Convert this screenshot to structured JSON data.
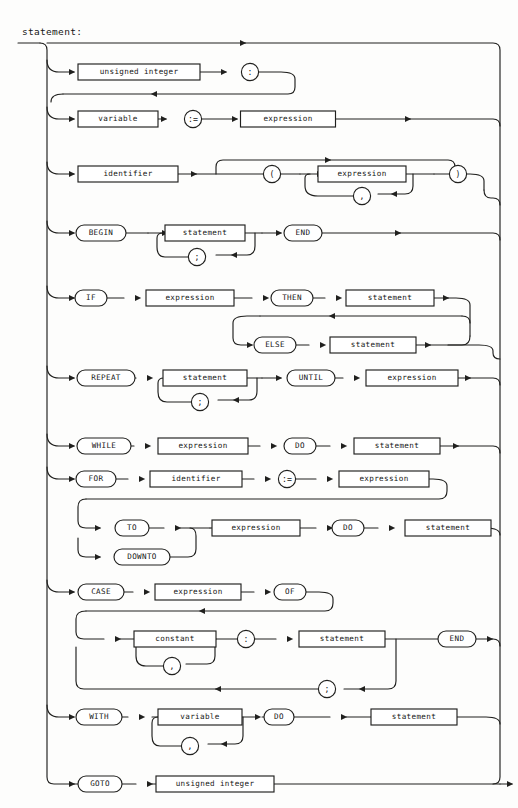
{
  "page": {
    "header_center": "",
    "header_right": "",
    "title": "statement:",
    "ink_color": "#20201e",
    "paper_color": "#fdfdfc"
  },
  "diagram": {
    "kind": "railroad-syntax-diagram",
    "name": "statement",
    "language": "Pascal",
    "alternatives": [
      {
        "id": "label-stmt",
        "index": 1,
        "nodes": [
          {
            "text": "unsigned integer",
            "shape": "box"
          },
          {
            "text": ":",
            "shape": "circle"
          }
        ],
        "note": "optional label prefix, loops back to statement alternatives"
      },
      {
        "id": "assignment",
        "index": 2,
        "nodes": [
          {
            "text": "variable",
            "shape": "box"
          },
          {
            "text": ":=",
            "shape": "circle"
          },
          {
            "text": "expression",
            "shape": "box"
          }
        ]
      },
      {
        "id": "procedure-call",
        "index": 3,
        "nodes": [
          {
            "text": "identifier",
            "shape": "box"
          },
          {
            "text": "(",
            "shape": "circle"
          },
          {
            "text": "expression",
            "shape": "box"
          },
          {
            "text": ",",
            "shape": "circle"
          },
          {
            "text": ")",
            "shape": "circle"
          }
        ],
        "note": "argument list optional; expressions separated by comma"
      },
      {
        "id": "compound",
        "index": 4,
        "nodes": [
          {
            "text": "BEGIN",
            "shape": "oval"
          },
          {
            "text": "statement",
            "shape": "box"
          },
          {
            "text": ";",
            "shape": "circle"
          },
          {
            "text": "END",
            "shape": "oval"
          }
        ]
      },
      {
        "id": "if-then-else",
        "index": 5,
        "nodes": [
          {
            "text": "IF",
            "shape": "oval"
          },
          {
            "text": "expression",
            "shape": "box"
          },
          {
            "text": "THEN",
            "shape": "oval"
          },
          {
            "text": "statement",
            "shape": "box"
          },
          {
            "text": "ELSE",
            "shape": "oval"
          },
          {
            "text": "statement",
            "shape": "box"
          }
        ]
      },
      {
        "id": "repeat-until",
        "index": 6,
        "nodes": [
          {
            "text": "REPEAT",
            "shape": "oval"
          },
          {
            "text": "statement",
            "shape": "box"
          },
          {
            "text": ";",
            "shape": "circle"
          },
          {
            "text": "UNTIL",
            "shape": "oval"
          },
          {
            "text": "expression",
            "shape": "box"
          }
        ]
      },
      {
        "id": "while-do",
        "index": 7,
        "nodes": [
          {
            "text": "WHILE",
            "shape": "oval"
          },
          {
            "text": "expression",
            "shape": "box"
          },
          {
            "text": "DO",
            "shape": "oval"
          },
          {
            "text": "statement",
            "shape": "box"
          }
        ]
      },
      {
        "id": "for-do",
        "index": 8,
        "nodes": [
          {
            "text": "FOR",
            "shape": "oval"
          },
          {
            "text": "identifier",
            "shape": "box"
          },
          {
            "text": ":=",
            "shape": "circle"
          },
          {
            "text": "expression",
            "shape": "box"
          },
          {
            "text": "TO",
            "shape": "oval"
          },
          {
            "text": "DOWNTO",
            "shape": "oval"
          },
          {
            "text": "expression",
            "shape": "box"
          },
          {
            "text": "DO",
            "shape": "oval"
          },
          {
            "text": "statement",
            "shape": "box"
          }
        ]
      },
      {
        "id": "case-of",
        "index": 9,
        "nodes": [
          {
            "text": "CASE",
            "shape": "oval"
          },
          {
            "text": "expression",
            "shape": "box"
          },
          {
            "text": "OF",
            "shape": "oval"
          },
          {
            "text": "constant",
            "shape": "box"
          },
          {
            "text": ",",
            "shape": "circle"
          },
          {
            "text": ":",
            "shape": "circle"
          },
          {
            "text": "statement",
            "shape": "box"
          },
          {
            "text": ";",
            "shape": "circle"
          },
          {
            "text": "END",
            "shape": "oval"
          }
        ]
      },
      {
        "id": "with-do",
        "index": 10,
        "nodes": [
          {
            "text": "WITH",
            "shape": "oval"
          },
          {
            "text": "variable",
            "shape": "box"
          },
          {
            "text": ",",
            "shape": "circle"
          },
          {
            "text": "DO",
            "shape": "oval"
          },
          {
            "text": "statement",
            "shape": "box"
          }
        ]
      },
      {
        "id": "goto",
        "index": 11,
        "nodes": [
          {
            "text": "GOTO",
            "shape": "oval"
          },
          {
            "text": "unsigned integer",
            "shape": "box"
          }
        ]
      }
    ],
    "tokens": {
      "unsigned_integer": "unsigned integer",
      "variable": "variable",
      "identifier": "identifier",
      "expression": "expression",
      "statement": "statement",
      "constant": "constant",
      "begin": "BEGIN",
      "end": "END",
      "if": "IF",
      "then": "THEN",
      "else": "ELSE",
      "repeat": "REPEAT",
      "until": "UNTIL",
      "while": "WHILE",
      "do": "DO",
      "for": "FOR",
      "to": "TO",
      "downto": "DOWNTO",
      "case": "CASE",
      "of": "OF",
      "with": "WITH",
      "goto": "GOTO",
      "colon": ":",
      "semicolon": ";",
      "comma": ",",
      "assign": ":=",
      "lparen": "(",
      "rparen": ")"
    }
  }
}
